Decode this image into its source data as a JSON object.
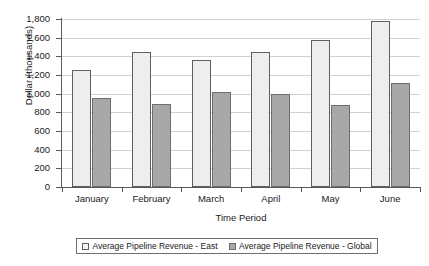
{
  "chart_data": {
    "type": "bar",
    "title": "",
    "subtitle": "",
    "xlabel": "Time Period",
    "ylabel": "Dollar (thousands)",
    "categories": [
      "January",
      "February",
      "March",
      "April",
      "May",
      "June"
    ],
    "series": [
      {
        "name": "Average Pipeline Revenue - East",
        "color": "#eeeeee",
        "values": [
          1250,
          1450,
          1360,
          1450,
          1580,
          1780
        ]
      },
      {
        "name": "Average Pipeline Revenue - Global",
        "color": "#a8a8a8",
        "values": [
          950,
          890,
          1020,
          1000,
          880,
          1110
        ]
      }
    ],
    "ylim": [
      0,
      1800
    ],
    "ytick_values": [
      0,
      200,
      400,
      600,
      800,
      1000,
      1200,
      1400,
      1600,
      1800
    ],
    "ytick_labels": [
      "0",
      "200",
      "400",
      "600",
      "800",
      "1,000",
      "1,200",
      "1,400",
      "1,600",
      "1,800"
    ],
    "grid": true,
    "grid_axis": "y",
    "legend_position": "bottom",
    "legend_border": true
  },
  "axes": {
    "y_title": "Dollar (thousands)",
    "x_title": "Time Period"
  },
  "legend": {
    "entries": [
      {
        "label": "Average Pipeline Revenue - East",
        "swatch": "series-east"
      },
      {
        "label": "Average Pipeline Revenue - Global",
        "swatch": "series-global"
      }
    ]
  }
}
